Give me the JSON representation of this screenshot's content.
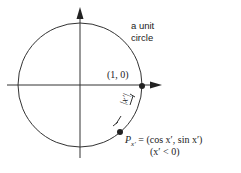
{
  "diagram": {
    "circle_label_line1": "a unit",
    "circle_label_line2": "circle",
    "point_label": "(1, 0)",
    "arc_label": "|x′|",
    "point_formula_P": "P",
    "point_formula_sub": "x′",
    "point_formula_rhs": " = (cos x′, sin x′)",
    "condition": "(x′ < 0)"
  }
}
